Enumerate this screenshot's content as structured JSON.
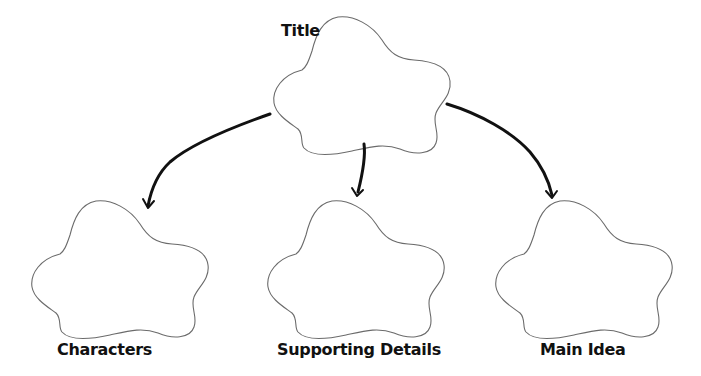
{
  "diagram": {
    "type": "graphic organizer / concept map",
    "nodes": [
      {
        "id": "title",
        "label": "Title",
        "shape": "cloud",
        "position": "top-center"
      },
      {
        "id": "characters",
        "label": "Characters",
        "shape": "cloud",
        "position": "bottom-left"
      },
      {
        "id": "supporting_details",
        "label": "Supporting Details",
        "shape": "cloud",
        "position": "bottom-center"
      },
      {
        "id": "main_idea",
        "label": "Main Idea",
        "shape": "cloud",
        "position": "bottom-right"
      }
    ],
    "edges": [
      {
        "from": "title",
        "to": "characters",
        "style": "hand-drawn curved arrow"
      },
      {
        "from": "title",
        "to": "supporting_details",
        "style": "hand-drawn arrow"
      },
      {
        "from": "title",
        "to": "main_idea",
        "style": "hand-drawn curved arrow"
      }
    ],
    "colors": {
      "background": "#ffffff",
      "cloud_stroke": "#6b6b6b",
      "arrow_stroke": "#111111",
      "label_text": "#111111"
    }
  },
  "labels": {
    "title": "Title",
    "characters": "Characters",
    "supporting_details": "Supporting Details",
    "main_idea": "Main Idea"
  }
}
